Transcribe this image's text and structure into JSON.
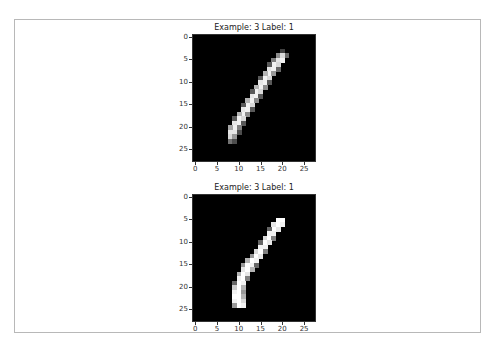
{
  "chart_data": [
    {
      "type": "heatmap",
      "title": "Example: 3  Label: 1",
      "colormap": "gray",
      "grid_size": [
        28,
        28
      ],
      "xlabel": "",
      "ylabel": "",
      "xticks": [
        "0",
        "5",
        "10",
        "15",
        "20",
        "25"
      ],
      "yticks": [
        "0",
        "5",
        "10",
        "15",
        "20",
        "25"
      ],
      "xlim": [
        0,
        27
      ],
      "ylim": [
        27,
        0
      ],
      "pixels": [
        [
          3,
          20,
          0.25
        ],
        [
          4,
          19,
          0.55
        ],
        [
          4,
          20,
          0.85
        ],
        [
          4,
          21,
          0.4
        ],
        [
          5,
          19,
          0.9
        ],
        [
          5,
          20,
          0.95
        ],
        [
          5,
          18,
          0.5
        ],
        [
          6,
          18,
          0.95
        ],
        [
          6,
          19,
          0.85
        ],
        [
          6,
          17,
          0.35
        ],
        [
          7,
          17,
          0.9
        ],
        [
          7,
          18,
          0.95
        ],
        [
          7,
          19,
          0.4
        ],
        [
          8,
          17,
          0.95
        ],
        [
          8,
          16,
          0.7
        ],
        [
          8,
          18,
          0.6
        ],
        [
          9,
          16,
          0.95
        ],
        [
          9,
          17,
          0.85
        ],
        [
          9,
          15,
          0.35
        ],
        [
          10,
          15,
          0.9
        ],
        [
          10,
          16,
          0.95
        ],
        [
          10,
          17,
          0.35
        ],
        [
          11,
          15,
          0.95
        ],
        [
          11,
          14,
          0.7
        ],
        [
          11,
          16,
          0.55
        ],
        [
          12,
          14,
          0.95
        ],
        [
          12,
          15,
          0.85
        ],
        [
          12,
          13,
          0.35
        ],
        [
          13,
          13,
          0.9
        ],
        [
          13,
          14,
          0.95
        ],
        [
          13,
          15,
          0.35
        ],
        [
          14,
          13,
          0.95
        ],
        [
          14,
          12,
          0.7
        ],
        [
          14,
          14,
          0.55
        ],
        [
          15,
          12,
          0.95
        ],
        [
          15,
          13,
          0.85
        ],
        [
          15,
          11,
          0.35
        ],
        [
          16,
          11,
          0.9
        ],
        [
          16,
          12,
          0.95
        ],
        [
          16,
          13,
          0.35
        ],
        [
          17,
          11,
          0.95
        ],
        [
          17,
          10,
          0.7
        ],
        [
          17,
          12,
          0.55
        ],
        [
          18,
          10,
          0.95
        ],
        [
          18,
          11,
          0.85
        ],
        [
          18,
          9,
          0.35
        ],
        [
          19,
          9,
          0.9
        ],
        [
          19,
          10,
          0.95
        ],
        [
          19,
          11,
          0.35
        ],
        [
          20,
          9,
          0.95
        ],
        [
          20,
          8,
          0.65
        ],
        [
          20,
          10,
          0.5
        ],
        [
          21,
          8,
          0.9
        ],
        [
          21,
          9,
          0.9
        ],
        [
          21,
          10,
          0.3
        ],
        [
          22,
          8,
          0.85
        ],
        [
          22,
          9,
          0.6
        ],
        [
          23,
          8,
          0.45
        ],
        [
          23,
          9,
          0.3
        ]
      ]
    },
    {
      "type": "heatmap",
      "title": "Example: 3  Label: 1",
      "colormap": "gray",
      "grid_size": [
        28,
        28
      ],
      "xlabel": "",
      "ylabel": "",
      "xticks": [
        "0",
        "5",
        "10",
        "15",
        "20",
        "25"
      ],
      "yticks": [
        "0",
        "5",
        "10",
        "15",
        "20",
        "25"
      ],
      "xlim": [
        0,
        27
      ],
      "ylim": [
        27,
        0
      ],
      "pixels": [
        [
          5,
          19,
          1.0
        ],
        [
          5,
          20,
          1.0
        ],
        [
          6,
          18,
          0.9
        ],
        [
          6,
          19,
          1.0
        ],
        [
          6,
          20,
          0.95
        ],
        [
          7,
          18,
          1.0
        ],
        [
          7,
          19,
          0.9
        ],
        [
          7,
          17,
          0.4
        ],
        [
          8,
          17,
          0.95
        ],
        [
          8,
          18,
          0.95
        ],
        [
          9,
          16,
          0.85
        ],
        [
          9,
          17,
          1.0
        ],
        [
          9,
          18,
          0.5
        ],
        [
          10,
          16,
          1.0
        ],
        [
          10,
          17,
          0.9
        ],
        [
          10,
          15,
          0.4
        ],
        [
          11,
          15,
          0.95
        ],
        [
          11,
          16,
          0.95
        ],
        [
          12,
          14,
          0.85
        ],
        [
          12,
          15,
          1.0
        ],
        [
          12,
          16,
          0.5
        ],
        [
          13,
          13,
          0.6
        ],
        [
          13,
          14,
          1.0
        ],
        [
          13,
          15,
          0.9
        ],
        [
          14,
          12,
          0.7
        ],
        [
          14,
          13,
          1.0
        ],
        [
          14,
          14,
          0.95
        ],
        [
          15,
          11,
          0.6
        ],
        [
          15,
          12,
          1.0
        ],
        [
          15,
          13,
          0.95
        ],
        [
          15,
          14,
          0.4
        ],
        [
          16,
          11,
          0.9
        ],
        [
          16,
          12,
          1.0
        ],
        [
          16,
          13,
          0.7
        ],
        [
          17,
          10,
          0.7
        ],
        [
          17,
          11,
          1.0
        ],
        [
          17,
          12,
          0.9
        ],
        [
          18,
          10,
          0.95
        ],
        [
          18,
          11,
          1.0
        ],
        [
          18,
          12,
          0.5
        ],
        [
          19,
          10,
          1.0
        ],
        [
          19,
          11,
          0.95
        ],
        [
          19,
          9,
          0.4
        ],
        [
          20,
          9,
          0.8
        ],
        [
          20,
          10,
          1.0
        ],
        [
          20,
          11,
          0.7
        ],
        [
          21,
          9,
          0.95
        ],
        [
          21,
          10,
          1.0
        ],
        [
          21,
          11,
          0.6
        ],
        [
          22,
          9,
          1.0
        ],
        [
          22,
          10,
          1.0
        ],
        [
          22,
          11,
          0.7
        ],
        [
          23,
          9,
          0.95
        ],
        [
          23,
          10,
          1.0
        ],
        [
          23,
          11,
          0.85
        ],
        [
          24,
          9,
          0.6
        ],
        [
          24,
          10,
          1.0
        ],
        [
          24,
          11,
          0.95
        ]
      ]
    }
  ],
  "panels": [
    {
      "title": "Example: 3  Label: 1"
    },
    {
      "title": "Example: 3  Label: 1"
    }
  ],
  "ticks": [
    "0",
    "5",
    "10",
    "15",
    "20",
    "25"
  ]
}
